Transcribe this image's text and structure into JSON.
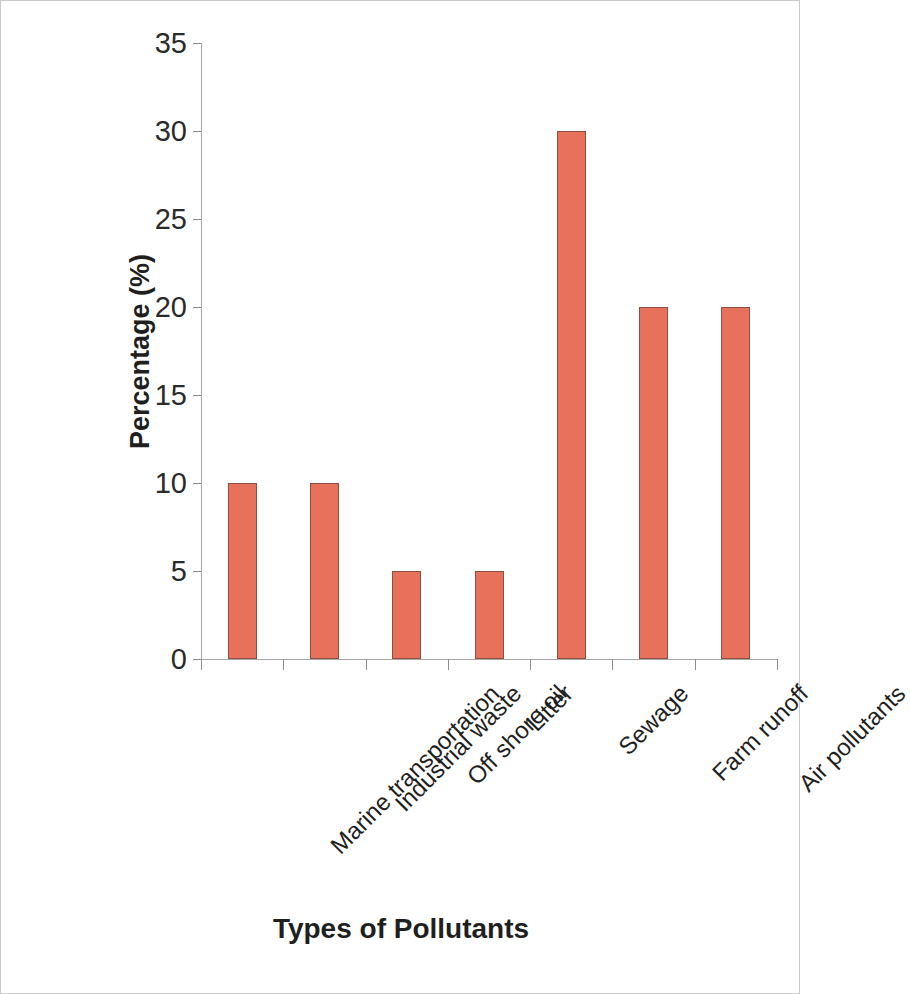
{
  "chart_data": {
    "type": "bar",
    "title": "",
    "subtitle": "",
    "xlabel": "Types of Pollutants",
    "ylabel": "Percentage (%)",
    "categories": [
      "Marine transportation",
      "Industrial waste",
      "Off shore oil",
      "Litter",
      "Sewage",
      "Farm runoff",
      "Air pollutants"
    ],
    "values": [
      10,
      10,
      5,
      5,
      30,
      20,
      20
    ],
    "ylim": [
      0,
      35
    ],
    "y_ticks": [
      0,
      5,
      10,
      15,
      20,
      25,
      30,
      35
    ],
    "y_tick_labels": [
      "0",
      "5",
      "10",
      "15",
      "20",
      "25",
      "30",
      "35"
    ],
    "grid": false,
    "legend": false,
    "legend_position": "none",
    "bar_color": "#e8715b",
    "bar_edge_color": "#8c5043",
    "axis_color": "#a6a6a6",
    "text_color": "#1f1f1f",
    "x_tick_label_rotation": -45,
    "annotations": []
  }
}
